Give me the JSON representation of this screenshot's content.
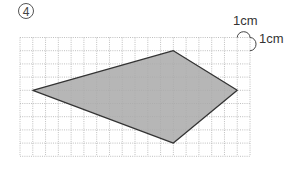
{
  "problem": {
    "number": "4",
    "unit_horizontal": "1cm",
    "unit_vertical": "1cm"
  },
  "grid": {
    "origin_x": 20,
    "origin_y": 37.5,
    "cell_w": 12.78,
    "cell_h": 13.2,
    "cols": 18,
    "rows": 9,
    "line_color": "#b8b8b8"
  },
  "shape": {
    "type": "kite",
    "vertices_grid": [
      [
        1,
        4
      ],
      [
        12,
        1
      ],
      [
        17,
        4
      ],
      [
        12,
        8
      ]
    ],
    "fill": "#a9a9a9",
    "stroke": "#333333"
  }
}
